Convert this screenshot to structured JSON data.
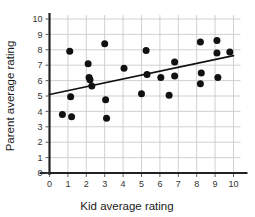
{
  "chart_data": {
    "type": "scatter",
    "title": "",
    "xlabel": "Kid average rating",
    "ylabel": "Parent average rating",
    "xlim": [
      0,
      10
    ],
    "ylim": [
      0,
      10
    ],
    "xticks": [
      0,
      1,
      2,
      3,
      4,
      5,
      6,
      7,
      8,
      9,
      10
    ],
    "yticks": [
      0,
      1,
      2,
      3,
      4,
      5,
      6,
      7,
      8,
      9,
      10
    ],
    "xtick_labels": [
      "0",
      "1",
      "2",
      "3",
      "4",
      "5",
      "6",
      "7",
      "8",
      "9",
      "10"
    ],
    "ytick_labels": [
      "0",
      "1",
      "2",
      "3",
      "4",
      "5",
      "6",
      "7",
      "8",
      "9",
      "10"
    ],
    "grid": true,
    "legend": null,
    "marker_color": "#111111",
    "grid_color": "#cccccc",
    "axis_color": "#333333",
    "trendline_color": "#111111",
    "points": [
      {
        "x": 0.7,
        "y": 3.8
      },
      {
        "x": 1.1,
        "y": 7.9
      },
      {
        "x": 1.15,
        "y": 4.95
      },
      {
        "x": 1.2,
        "y": 3.65
      },
      {
        "x": 2.1,
        "y": 7.1
      },
      {
        "x": 2.15,
        "y": 6.2
      },
      {
        "x": 2.2,
        "y": 6.05
      },
      {
        "x": 2.3,
        "y": 5.65
      },
      {
        "x": 3.0,
        "y": 8.4
      },
      {
        "x": 3.05,
        "y": 4.75
      },
      {
        "x": 3.1,
        "y": 3.55
      },
      {
        "x": 4.05,
        "y": 6.8
      },
      {
        "x": 5.0,
        "y": 5.15
      },
      {
        "x": 5.25,
        "y": 7.95
      },
      {
        "x": 5.3,
        "y": 6.4
      },
      {
        "x": 6.05,
        "y": 6.2
      },
      {
        "x": 6.5,
        "y": 5.05
      },
      {
        "x": 6.8,
        "y": 7.2
      },
      {
        "x": 6.8,
        "y": 6.3
      },
      {
        "x": 8.2,
        "y": 8.5
      },
      {
        "x": 8.25,
        "y": 6.5
      },
      {
        "x": 8.2,
        "y": 5.8
      },
      {
        "x": 9.1,
        "y": 8.6
      },
      {
        "x": 9.1,
        "y": 7.8
      },
      {
        "x": 9.15,
        "y": 6.2
      },
      {
        "x": 9.8,
        "y": 7.85
      }
    ],
    "trendline": {
      "x0": 0.0,
      "y0": 5.1,
      "x1": 10.0,
      "y1": 7.62
    }
  }
}
